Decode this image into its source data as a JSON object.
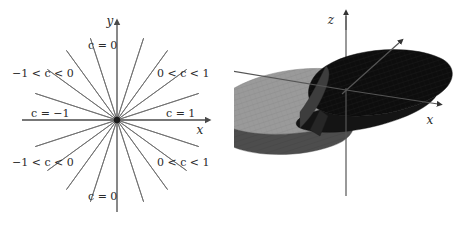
{
  "figure": {
    "title": "",
    "panels": [
      {
        "id": "contour-plot",
        "name": "level-curves-of-c",
        "kind": "contour-diagram"
      },
      {
        "id": "surface-plot",
        "name": "saddle-surface",
        "kind": "3d-surface"
      }
    ]
  },
  "contour": {
    "axis_x_label": "x",
    "axis_y_label": "y",
    "labels": {
      "top_c0": "c = 0",
      "bottom_c0": "c = 0",
      "left_c_neg1": "c = −1",
      "right_c_1": "c = 1",
      "upper_left_range": "−1 < c < 0",
      "upper_right_range": "0 < c < 1",
      "lower_left_range": "−1 < c < 0",
      "lower_right_range": "0 < c < 1"
    },
    "origin_marker": "filled-dot",
    "ray_count": 20,
    "ray_stroke_color": "#6e6e6e",
    "axis_stroke_color": "#4a4a4a"
  },
  "surface": {
    "axis_x_label": "x",
    "axis_y_label": "",
    "axis_z_label": "z",
    "light_lobe_color": "#9a9a9a",
    "dark_lobe_color": "#0d0d0d",
    "mid_shade_color": "#5a5a5a",
    "axis_stroke_color": "#555555"
  },
  "chart_data": {
    "type": "line",
    "title": "",
    "xlabel": "x",
    "ylabel": "y",
    "grid": false,
    "legend": "none",
    "series": [
      {
        "name": "c = 0",
        "slope": 0,
        "label_positions": [
          "top",
          "bottom"
        ]
      },
      {
        "name": "c = 1",
        "slope": 1,
        "label_positions": [
          "right"
        ]
      },
      {
        "name": "c = -1",
        "slope": -1,
        "label_positions": [
          "left"
        ]
      },
      {
        "name": "-1 < c < 0",
        "slope_range": [
          -1,
          0
        ],
        "label_positions": [
          "upper-left",
          "lower-left"
        ]
      },
      {
        "name": "0 < c < 1",
        "slope_range": [
          0,
          1
        ],
        "label_positions": [
          "upper-right",
          "lower-right"
        ]
      }
    ],
    "ray_angles_deg": [
      0,
      18,
      36,
      54,
      72,
      90,
      108,
      126,
      144,
      162,
      180,
      198,
      216,
      234,
      252,
      270,
      288,
      306,
      324,
      342
    ],
    "xlim": [
      -1,
      1
    ],
    "ylim": [
      -1,
      1
    ]
  }
}
